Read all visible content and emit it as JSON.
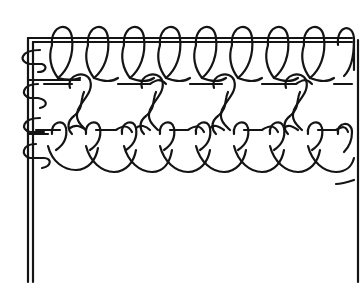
{
  "figure": {
    "caption": "",
    "colors": {
      "ink": "#141414",
      "background": "#ffffff"
    },
    "elements": {
      "frame": {
        "left_double_line": true,
        "right_single_line": true,
        "top_double_line": true
      },
      "rows": [
        {
          "name": "top-loop-row",
          "loop_count": 9,
          "type": "tall overhand loops hitched over top double cord"
        },
        {
          "name": "middle-link-row",
          "link_count": 4,
          "type": "twisted diagonal connecting links"
        },
        {
          "name": "bottom-scallop-row",
          "loop_count": 9,
          "type": "small loops with hanging scallops"
        }
      ],
      "end_mark": "short dash at lower right"
    }
  }
}
